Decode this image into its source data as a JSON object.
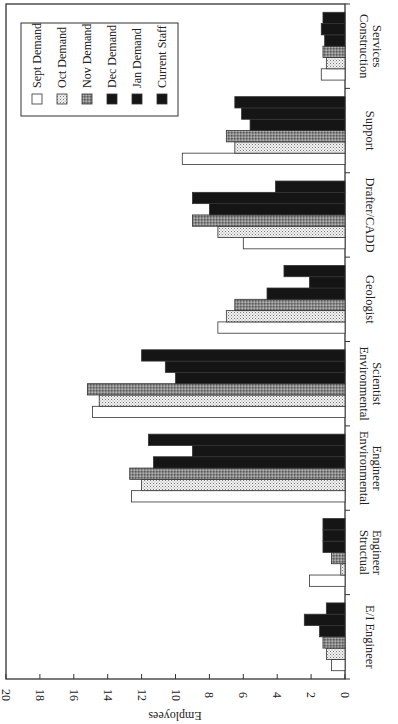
{
  "chart_data": {
    "type": "bar",
    "orientation": "vertical bars, image rotated 90° clockwise",
    "title": "",
    "xlabel": "",
    "ylabel": "Employees",
    "ylim": [
      0,
      20
    ],
    "yticks": [
      0,
      2,
      4,
      6,
      8,
      10,
      12,
      14,
      16,
      18,
      20
    ],
    "grid": false,
    "legend_position": "upper right (top-left in rotated image)",
    "categories": [
      "E/I Engineer",
      "Structual Engineer",
      "Environmental Engineer",
      "Environmental Scientist",
      "Geologist",
      "Drafter/CADD",
      "Support",
      "Construction Services"
    ],
    "category_labels": [
      [
        "E/I Engineer"
      ],
      [
        "Structual",
        "Engineer"
      ],
      [
        "Environmental",
        "Engineer"
      ],
      [
        "Environmental",
        "Scientist"
      ],
      [
        "Geologist"
      ],
      [
        "Drafter/CADD"
      ],
      [
        "Support"
      ],
      [
        "Construction",
        "Services"
      ]
    ],
    "series": [
      {
        "name": "Sept Demand",
        "fill": "white",
        "values": [
          0.8,
          2.1,
          12.6,
          14.9,
          7.5,
          6.0,
          9.6,
          1.4
        ]
      },
      {
        "name": "Oct Demand",
        "fill": "light-dots",
        "values": [
          1.1,
          0.25,
          12.0,
          14.5,
          7.0,
          7.5,
          6.5,
          1.1
        ]
      },
      {
        "name": "Nov Demand",
        "fill": "dark-grid",
        "values": [
          1.3,
          0.8,
          12.7,
          15.2,
          6.5,
          9.0,
          7.0,
          1.3
        ]
      },
      {
        "name": "Dec Demand",
        "fill": "black",
        "values": [
          1.5,
          1.3,
          11.3,
          10.0,
          4.6,
          8.0,
          5.6,
          1.2
        ]
      },
      {
        "name": "Jan Demand",
        "fill": "black",
        "values": [
          2.4,
          1.3,
          9.0,
          10.6,
          2.1,
          9.0,
          6.1,
          1.4
        ]
      },
      {
        "name": "Current Staff",
        "fill": "black",
        "values": [
          1.1,
          1.3,
          11.6,
          12.0,
          3.6,
          4.1,
          6.5,
          1.3
        ]
      }
    ]
  },
  "legend": {
    "items": [
      "Sept Demand",
      "Oct Demand",
      "Nov Demand",
      "Dec Demand",
      "Jan Demand",
      "Current Staff"
    ]
  },
  "axis": {
    "y_label": "Employees",
    "ticks": [
      "0",
      "2",
      "4",
      "6",
      "8",
      "10",
      "12",
      "14",
      "16",
      "18",
      "20"
    ]
  }
}
